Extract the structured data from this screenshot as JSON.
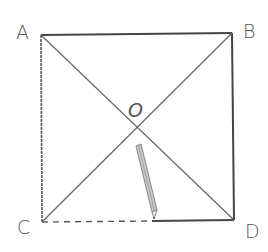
{
  "diagram": {
    "labels": {
      "A": "A",
      "B": "B",
      "C": "C",
      "D": "D",
      "O": "O"
    },
    "points": {
      "A": [
        41,
        35
      ],
      "B": [
        232,
        33
      ],
      "C": [
        42,
        222
      ],
      "D": [
        234,
        220
      ],
      "O": [
        137,
        128
      ]
    },
    "colors": {
      "line": "#444444",
      "diagonal": "#666666",
      "pencil": "#9a9a9a"
    }
  }
}
